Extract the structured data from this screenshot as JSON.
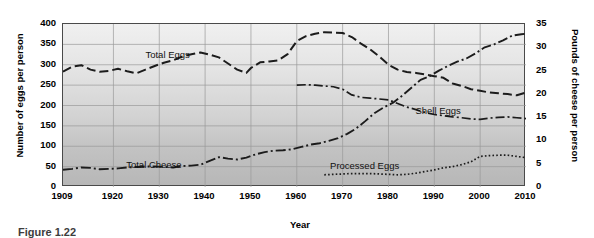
{
  "figure": {
    "caption": "Figure 1.22"
  },
  "chart_data": {
    "type": "line",
    "title": "",
    "xlabel": "Year",
    "ylabel": "Number of eggs per person",
    "ylabel_right": "Pounds of cheese per person",
    "xlim": [
      1909,
      2010
    ],
    "ylim": [
      0,
      400
    ],
    "ylim_right": [
      0,
      35
    ],
    "grid": true,
    "legend_position": "inline-labels",
    "xticks": [
      "1909",
      "1920",
      "1930",
      "1940",
      "1950",
      "1960",
      "1970",
      "1980",
      "1990",
      "2000",
      "2010"
    ],
    "xtick_values": [
      1909,
      1920,
      1930,
      1940,
      1950,
      1960,
      1970,
      1980,
      1990,
      2000,
      2010
    ],
    "yticks_left": [
      "0",
      "50",
      "100",
      "150",
      "200",
      "250",
      "300",
      "350",
      "400"
    ],
    "ytick_values_left": [
      0,
      50,
      100,
      150,
      200,
      250,
      300,
      350,
      400
    ],
    "yticks_right": [
      "0",
      "5",
      "10",
      "15",
      "20",
      "25",
      "30",
      "35"
    ],
    "ytick_values_right": [
      0,
      5,
      10,
      15,
      20,
      25,
      30,
      35
    ],
    "series": [
      {
        "name": "Total Eggs",
        "axis": "left",
        "style": "long-dash",
        "label_x": 1932,
        "label_y": 322,
        "x": [
          1909,
          1911,
          1913,
          1915,
          1917,
          1919,
          1921,
          1923,
          1925,
          1927,
          1929,
          1931,
          1933,
          1935,
          1937,
          1939,
          1941,
          1943,
          1945,
          1947,
          1949,
          1950,
          1952,
          1954,
          1956,
          1958,
          1960,
          1962,
          1964,
          1966,
          1968,
          1970,
          1972,
          1974,
          1976,
          1978,
          1980,
          1982,
          1984,
          1986,
          1988,
          1990,
          1992,
          1994,
          1996,
          1998,
          2000,
          2002,
          2004,
          2006,
          2008,
          2010
        ],
        "y": [
          283,
          295,
          299,
          288,
          283,
          285,
          290,
          284,
          279,
          288,
          297,
          305,
          311,
          320,
          326,
          330,
          325,
          318,
          303,
          288,
          280,
          292,
          306,
          308,
          311,
          326,
          358,
          370,
          376,
          380,
          379,
          378,
          368,
          352,
          338,
          320,
          300,
          288,
          282,
          280,
          276,
          272,
          268,
          254,
          248,
          240,
          236,
          232,
          230,
          228,
          225,
          232
        ]
      },
      {
        "name": "Shell Eggs",
        "axis": "left",
        "style": "dash-dot",
        "label_x": 1991,
        "label_y": 183,
        "x": [
          1960,
          1962,
          1964,
          1966,
          1968,
          1970,
          1972,
          1974,
          1976,
          1978,
          1980,
          1982,
          1984,
          1986,
          1988,
          1990,
          1992,
          1994,
          1996,
          1998,
          2000,
          2002,
          2004,
          2006,
          2008,
          2010
        ],
        "y": [
          250,
          251,
          250,
          248,
          246,
          240,
          226,
          220,
          218,
          216,
          214,
          205,
          196,
          190,
          183,
          178,
          175,
          172,
          170,
          167,
          166,
          169,
          171,
          172,
          170,
          168
        ]
      },
      {
        "name": "Processed Eggs",
        "axis": "left",
        "style": "dotted",
        "label_x": 1975,
        "label_y": 48,
        "x": [
          1966,
          1968,
          1970,
          1972,
          1974,
          1976,
          1978,
          1980,
          1982,
          1984,
          1986,
          1988,
          1990,
          1992,
          1994,
          1996,
          1998,
          2000,
          2002,
          2004,
          2006,
          2008,
          2010
        ],
        "y": [
          30,
          31,
          32,
          33,
          33,
          33,
          32,
          31,
          30,
          31,
          34,
          38,
          42,
          47,
          50,
          55,
          62,
          75,
          77,
          78,
          78,
          75,
          72
        ]
      },
      {
        "name": "Total Cheese",
        "axis": "right",
        "style": "dash-dot-long",
        "label_x": 1929,
        "label_y": 4.6,
        "x": [
          1909,
          1911,
          1913,
          1915,
          1917,
          1919,
          1921,
          1923,
          1925,
          1927,
          1929,
          1931,
          1933,
          1935,
          1937,
          1939,
          1941,
          1943,
          1945,
          1947,
          1949,
          1951,
          1953,
          1955,
          1957,
          1959,
          1961,
          1963,
          1965,
          1967,
          1969,
          1971,
          1973,
          1975,
          1977,
          1979,
          1981,
          1983,
          1985,
          1987,
          1989,
          1991,
          1993,
          1995,
          1997,
          1999,
          2001,
          2003,
          2005,
          2007,
          2009,
          2010
        ],
        "y": [
          3.7,
          3.9,
          4.2,
          4.1,
          3.8,
          3.9,
          4.0,
          4.2,
          4.3,
          4.4,
          4.4,
          4.3,
          4.2,
          4.5,
          4.6,
          4.8,
          5.6,
          6.4,
          6.1,
          5.9,
          6.3,
          7.0,
          7.5,
          7.8,
          7.9,
          8.1,
          8.6,
          9.1,
          9.4,
          9.9,
          10.5,
          11.4,
          12.6,
          14.2,
          15.9,
          17.1,
          18.1,
          19.6,
          21.3,
          23.0,
          23.8,
          25.0,
          26.0,
          26.9,
          27.6,
          28.7,
          30.0,
          30.6,
          31.5,
          32.5,
          32.8,
          32.9
        ]
      }
    ]
  }
}
